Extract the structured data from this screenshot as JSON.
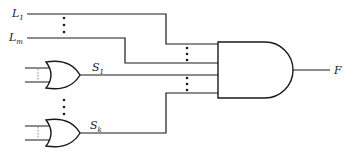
{
  "diagram": {
    "type": "logic-circuit",
    "inputs_literals": [
      {
        "base": "L",
        "sub": "1"
      },
      {
        "base": "L",
        "sub": "m"
      }
    ],
    "or_gate_outputs": [
      {
        "base": "S",
        "sub": "1"
      },
      {
        "base": "S",
        "sub": "k"
      }
    ],
    "output": {
      "label": "F"
    },
    "gates": [
      {
        "kind": "OR",
        "output": "S1"
      },
      {
        "kind": "OR",
        "output": "Sk"
      },
      {
        "kind": "AND",
        "output": "F"
      }
    ],
    "colors": {
      "line": "#1a1a1a",
      "background": "#ffffff"
    }
  }
}
